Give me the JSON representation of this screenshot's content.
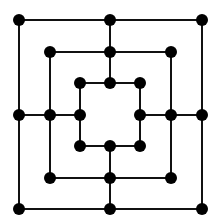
{
  "game": {
    "name": "Nine Men's Morris board",
    "colors": {
      "line": "#111111",
      "point": "#000000",
      "background": "#ffffff"
    },
    "squares": [
      {
        "name": "outer",
        "x1": 19,
        "y1": 20,
        "x2": 202,
        "y2": 209
      },
      {
        "name": "middle",
        "x1": 50,
        "y1": 52,
        "x2": 171,
        "y2": 178
      },
      {
        "name": "inner",
        "x1": 80,
        "y1": 83,
        "x2": 140,
        "y2": 146
      }
    ],
    "connectors": [
      {
        "name": "top",
        "x1": 110,
        "y1": 20,
        "x2": 110,
        "y2": 83
      },
      {
        "name": "bottom",
        "x1": 110,
        "y1": 146,
        "x2": 110,
        "y2": 209
      },
      {
        "name": "left",
        "x1": 19,
        "y1": 115,
        "x2": 80,
        "y2": 115
      },
      {
        "name": "right",
        "x1": 140,
        "y1": 115,
        "x2": 202,
        "y2": 115
      }
    ],
    "point_radius": 6
  }
}
